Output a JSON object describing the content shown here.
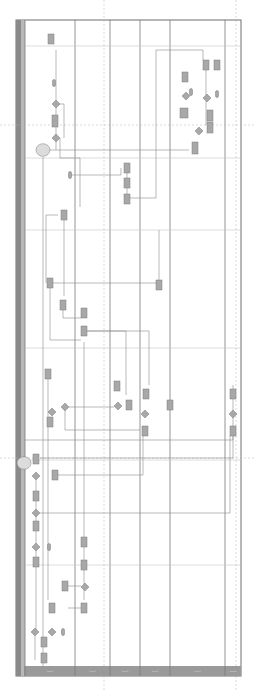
{
  "diagram": {
    "type": "swimlane-flowchart",
    "orientation": "rotated-vertical",
    "colors": {
      "background": "#ffffff",
      "frame": "#6e6e6e",
      "left_bar": "#8a8a8a",
      "left_bar_inner": "#b8b8b8",
      "lane_line": "#7a7a7a",
      "phase_line": "#c8c8c8",
      "dashed_line": "#b0b0b0",
      "connector": "#8c8c8c",
      "shape_fill": "#a8a8a8",
      "shape_stroke": "#7c7c7c",
      "header_fill": "#9a9a9a",
      "cloud_fill": "#dcdcdc"
    },
    "frame": {
      "x": 16,
      "y": 20,
      "w": 225,
      "h": 656
    },
    "header": {
      "x": 25,
      "y": 666,
      "h": 10
    },
    "lanes": [
      {
        "label": "Lane 1",
        "x1": 25,
        "x2": 75
      },
      {
        "label": "Lane 2",
        "x1": 75,
        "x2": 110
      },
      {
        "label": "Lane 3",
        "x1": 110,
        "x2": 140
      },
      {
        "label": "Lane 4",
        "x1": 140,
        "x2": 170
      },
      {
        "label": "Lane 5",
        "x1": 170,
        "x2": 225
      },
      {
        "label": "Lane 6",
        "x1": 225,
        "x2": 241
      }
    ],
    "phase_lines_y": [
      46,
      158,
      230,
      348,
      460,
      565
    ],
    "dashed_vertical_x": [
      104,
      236
    ],
    "dashed_horizontal_y": [
      125,
      458
    ],
    "boxes": [
      [
        48,
        34,
        6,
        10
      ],
      [
        203,
        60,
        6,
        10
      ],
      [
        214,
        60,
        6,
        10
      ],
      [
        182,
        72,
        6,
        10
      ],
      [
        180,
        108,
        8,
        10
      ],
      [
        207,
        110,
        6,
        11
      ],
      [
        207,
        122,
        6,
        11
      ],
      [
        192,
        142,
        6,
        12
      ],
      [
        52,
        115,
        6,
        12
      ],
      [
        124,
        163,
        6,
        10
      ],
      [
        124,
        178,
        6,
        10
      ],
      [
        124,
        194,
        6,
        10
      ],
      [
        61,
        210,
        6,
        10
      ],
      [
        47,
        278,
        6,
        10
      ],
      [
        60,
        300,
        6,
        10
      ],
      [
        81,
        308,
        6,
        10
      ],
      [
        81,
        326,
        6,
        10
      ],
      [
        156,
        280,
        6,
        10
      ],
      [
        45,
        369,
        6,
        10
      ],
      [
        114,
        381,
        6,
        10
      ],
      [
        126,
        400,
        6,
        10
      ],
      [
        143,
        389,
        6,
        10
      ],
      [
        142,
        426,
        6,
        10
      ],
      [
        167,
        400,
        6,
        10
      ],
      [
        230,
        389,
        6,
        10
      ],
      [
        230,
        426,
        6,
        10
      ],
      [
        47,
        417,
        6,
        10
      ],
      [
        33,
        454,
        6,
        10
      ],
      [
        52,
        470,
        6,
        10
      ],
      [
        33,
        491,
        6,
        10
      ],
      [
        33,
        521,
        6,
        10
      ],
      [
        33,
        557,
        6,
        10
      ],
      [
        81,
        537,
        6,
        10
      ],
      [
        81,
        560,
        6,
        10
      ],
      [
        62,
        581,
        6,
        10
      ],
      [
        49,
        603,
        6,
        10
      ],
      [
        81,
        603,
        6,
        10
      ],
      [
        41,
        637,
        6,
        10
      ],
      [
        41,
        653,
        6,
        10
      ]
    ],
    "diamonds": [
      [
        56,
        104,
        4
      ],
      [
        56,
        138,
        4
      ],
      [
        186,
        96,
        4
      ],
      [
        207,
        98,
        4
      ],
      [
        199,
        131,
        4
      ],
      [
        52,
        412,
        4
      ],
      [
        65,
        407,
        4
      ],
      [
        118,
        406,
        4
      ],
      [
        145,
        414,
        4
      ],
      [
        233,
        414,
        4
      ],
      [
        36,
        476,
        4
      ],
      [
        36,
        513,
        4
      ],
      [
        36,
        547,
        4
      ],
      [
        85,
        587,
        4
      ],
      [
        52,
        632,
        4
      ],
      [
        35,
        632,
        4
      ]
    ],
    "terminators": [
      [
        54,
        83,
        3,
        7
      ],
      [
        70,
        175,
        3,
        7
      ],
      [
        191,
        92,
        3,
        7
      ],
      [
        217,
        94,
        3,
        7
      ],
      [
        49,
        547,
        3,
        7
      ],
      [
        63,
        632,
        3,
        7
      ]
    ],
    "clouds": [
      [
        43,
        150,
        7
      ],
      [
        24,
        463,
        7
      ]
    ],
    "connectors": [
      [
        [
          56,
          50
        ],
        [
          56,
          150
        ]
      ],
      [
        [
          56,
          104
        ],
        [
          64,
          104
        ],
        [
          64,
          138
        ]
      ],
      [
        [
          60,
          138
        ],
        [
          60,
          158
        ],
        [
          80,
          158
        ],
        [
          80,
          207
        ]
      ],
      [
        [
          70,
          175
        ],
        [
          121,
          175
        ],
        [
          121,
          168
        ]
      ],
      [
        [
          127,
          173
        ],
        [
          127,
          194
        ]
      ],
      [
        [
          130,
          198
        ],
        [
          156,
          198
        ],
        [
          156,
          50
        ],
        [
          203,
          50
        ],
        [
          203,
          60
        ]
      ],
      [
        [
          206,
          70
        ],
        [
          206,
          125
        ]
      ],
      [
        [
          189,
          150
        ],
        [
          40,
          150
        ]
      ],
      [
        [
          43,
          157
        ],
        [
          43,
          676
        ]
      ],
      [
        [
          64,
          215
        ],
        [
          64,
          296
        ]
      ],
      [
        [
          58,
          215
        ],
        [
          46,
          215
        ],
        [
          46,
          283
        ]
      ],
      [
        [
          53,
          283
        ],
        [
          156,
          283
        ]
      ],
      [
        [
          159,
          230
        ],
        [
          159,
          280
        ]
      ],
      [
        [
          63,
          305
        ],
        [
          63,
          318
        ],
        [
          81,
          318
        ]
      ],
      [
        [
          50,
          288
        ],
        [
          50,
          340
        ],
        [
          81,
          340
        ]
      ],
      [
        [
          87,
          331
        ],
        [
          126,
          331
        ],
        [
          126,
          395
        ]
      ],
      [
        [
          87,
          331
        ],
        [
          149,
          331
        ],
        [
          149,
          385
        ]
      ],
      [
        [
          48,
          379
        ],
        [
          48,
          600
        ]
      ],
      [
        [
          69,
          407
        ],
        [
          114,
          407
        ]
      ],
      [
        [
          65,
          411
        ],
        [
          65,
          430
        ],
        [
          140,
          430
        ]
      ],
      [
        [
          25,
          440
        ],
        [
          233,
          440
        ],
        [
          233,
          385
        ]
      ],
      [
        [
          40,
          458
        ],
        [
          233,
          458
        ],
        [
          233,
          436
        ]
      ],
      [
        [
          36,
          480
        ],
        [
          36,
          630
        ]
      ],
      [
        [
          40,
          513
        ],
        [
          230,
          513
        ],
        [
          230,
          436
        ]
      ],
      [
        [
          56,
          475
        ],
        [
          143,
          475
        ],
        [
          143,
          436
        ]
      ],
      [
        [
          84,
          342
        ],
        [
          84,
          600
        ]
      ],
      [
        [
          68,
          586
        ],
        [
          81,
          586
        ]
      ],
      [
        [
          68,
          608
        ],
        [
          81,
          608
        ]
      ],
      [
        [
          35,
          636
        ],
        [
          35,
          660
        ]
      ]
    ]
  }
}
